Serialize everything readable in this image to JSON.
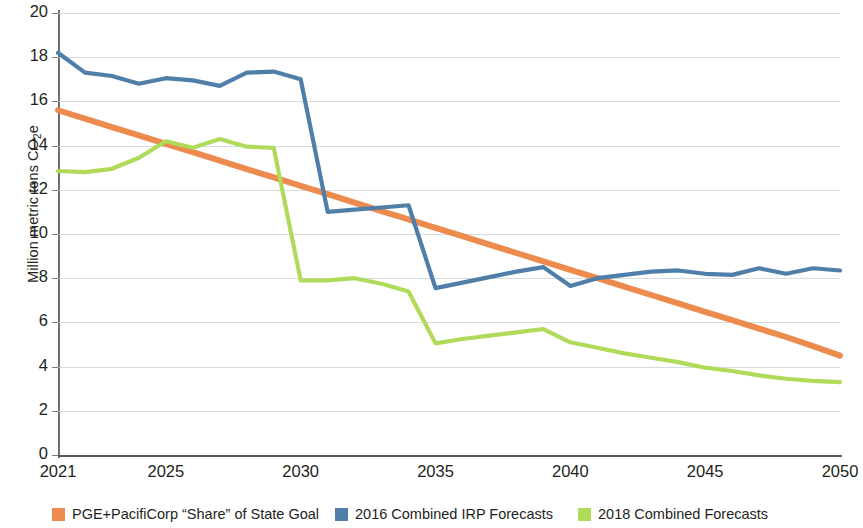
{
  "chart_data": {
    "type": "line",
    "title": "",
    "xlabel": "",
    "ylabel": "Million metric tons CO2e",
    "ylabel_prefix": "Million metric tons CO",
    "ylabel_sub": "2",
    "ylabel_suffix": "e",
    "xlim": [
      2021,
      2050
    ],
    "ylim": [
      0,
      20
    ],
    "ytick_labels": [
      "20",
      "18",
      "16",
      "14",
      "12",
      "10",
      "8",
      "6",
      "4",
      "2",
      "0"
    ],
    "ytick_values": [
      20,
      18,
      16,
      14,
      12,
      10,
      8,
      6,
      4,
      2,
      0
    ],
    "xtick_labels": [
      "2021",
      "2025",
      "2030",
      "2035",
      "2040",
      "2045",
      "2050"
    ],
    "xtick_values": [
      2021,
      2025,
      2030,
      2035,
      2040,
      2045,
      2050
    ],
    "grid": true,
    "grid_axis": "y",
    "legend_position": "bottom",
    "x": [
      2021,
      2022,
      2023,
      2024,
      2025,
      2026,
      2027,
      2028,
      2029,
      2030,
      2031,
      2032,
      2033,
      2034,
      2035,
      2036,
      2037,
      2038,
      2039,
      2040,
      2041,
      2042,
      2043,
      2044,
      2045,
      2046,
      2047,
      2048,
      2049,
      2050
    ],
    "series": [
      {
        "name": "PGE+PacifiCorp “Share” of State Goal",
        "color": "#ED8B4F",
        "values": [
          15.6,
          15.22,
          14.84,
          14.46,
          14.08,
          13.7,
          13.32,
          12.94,
          12.56,
          12.18,
          11.8,
          11.42,
          11.04,
          10.66,
          10.28,
          9.9,
          9.52,
          9.14,
          8.76,
          8.38,
          8.0,
          7.62,
          7.24,
          6.86,
          6.48,
          6.1,
          5.72,
          5.34,
          4.93,
          4.5
        ]
      },
      {
        "name": "2016 Combined IRP Forecasts",
        "color": "#4F7FA8",
        "values": [
          18.2,
          17.3,
          17.15,
          16.8,
          17.05,
          16.95,
          16.7,
          17.3,
          17.35,
          17.0,
          11.0,
          11.1,
          11.2,
          11.3,
          7.55,
          7.8,
          8.05,
          8.3,
          8.5,
          7.65,
          8.0,
          8.15,
          8.3,
          8.35,
          8.2,
          8.15,
          8.45,
          8.2,
          8.45,
          8.35
        ]
      },
      {
        "name": "2018 Combined Forecasts",
        "color": "#B0DB5A",
        "values": [
          12.85,
          12.8,
          12.95,
          13.45,
          14.2,
          13.9,
          14.3,
          13.95,
          13.9,
          7.9,
          7.9,
          8.0,
          7.75,
          7.4,
          5.05,
          5.25,
          5.4,
          5.55,
          5.7,
          5.1,
          4.85,
          4.6,
          4.4,
          4.2,
          3.95,
          3.8,
          3.6,
          3.45,
          3.35,
          3.3
        ]
      }
    ]
  },
  "legend": {
    "items": [
      {
        "label": "PGE+PacifiCorp “Share” of State Goal",
        "color": "#ED8B4F"
      },
      {
        "label": "2016 Combined IRP Forecasts",
        "color": "#4F7FA8"
      },
      {
        "label": "2018 Combined Forecasts",
        "color": "#B0DB5A"
      }
    ]
  }
}
